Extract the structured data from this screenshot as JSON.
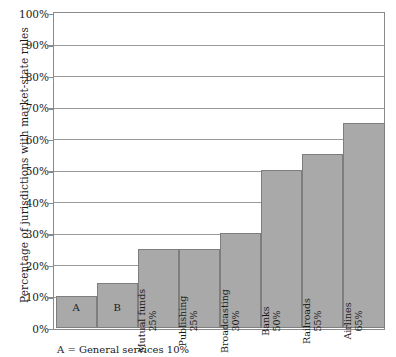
{
  "chart_data": {
    "type": "bar",
    "title": "",
    "xlabel": "",
    "ylabel": "Percentage of jurisdictions with market-state rules",
    "ylim": [
      0,
      100
    ],
    "grid": true,
    "legend": "none",
    "ytick_labels": [
      "100%",
      "90%",
      "80%",
      "70%",
      "60%",
      "50%",
      "40%",
      "30%",
      "20%",
      "10%",
      "0%"
    ],
    "ytick_values": [
      100,
      90,
      80,
      70,
      60,
      50,
      40,
      30,
      20,
      10,
      0
    ],
    "categories": [
      "A",
      "B",
      "Mutual funds",
      "Publishing",
      "Broadcasting",
      "Banks",
      "Railroads",
      "Airlines"
    ],
    "values": [
      10,
      14,
      25,
      25,
      30,
      50,
      55,
      65
    ],
    "bars": [
      {
        "name": "A",
        "value": 10,
        "value_label": "",
        "orientation": "horizontal"
      },
      {
        "name": "B",
        "value": 14,
        "value_label": "",
        "orientation": "horizontal"
      },
      {
        "name": "Mutual funds",
        "value": 25,
        "value_label": "25%",
        "orientation": "vertical"
      },
      {
        "name": "Publishing",
        "value": 25,
        "value_label": "25%",
        "orientation": "vertical"
      },
      {
        "name": "Broadcasting",
        "value": 30,
        "value_label": "30%",
        "orientation": "vertical"
      },
      {
        "name": "Banks",
        "value": 50,
        "value_label": "50%",
        "orientation": "vertical"
      },
      {
        "name": "Railroads",
        "value": 55,
        "value_label": "55%",
        "orientation": "vertical"
      },
      {
        "name": "Airlines",
        "value": 65,
        "value_label": "65%",
        "orientation": "vertical"
      }
    ],
    "annotations": [
      "A = General services 10%"
    ],
    "colors": {
      "bar_fill": "#a9a9a9",
      "bar_stroke": "#7e7e7e",
      "gridline": "#9a9a9a",
      "axis": "#8a8a8a",
      "text": "#1a1a1a",
      "background": "#ffffff"
    }
  },
  "footnote": {
    "text": "A = General services 10%"
  }
}
